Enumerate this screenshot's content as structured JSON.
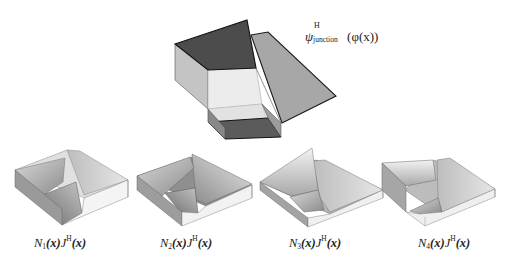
{
  "figure": {
    "main": {
      "label_symbol": "ψ",
      "label_superscript": "H",
      "label_subscript": "junction",
      "label_argument": "(φ(x))",
      "description": "3D rendering of a junction enrichment function"
    },
    "panels": [
      {
        "id": "N1",
        "basis": "N",
        "index": "1",
        "arg": "(x)",
        "enrich": "J",
        "enrich_sup": "H",
        "enrich_arg": "(x)"
      },
      {
        "id": "N2",
        "basis": "N",
        "index": "2",
        "arg": "(x)",
        "enrich": "J",
        "enrich_sup": "H",
        "enrich_arg": "(x)"
      },
      {
        "id": "N3",
        "basis": "N",
        "index": "3",
        "arg": "(x)",
        "enrich": "J",
        "enrich_sup": "H",
        "enrich_arg": "(x)"
      },
      {
        "id": "N4",
        "basis": "N",
        "index": "4",
        "arg": "(x)",
        "enrich": "J",
        "enrich_sup": "H",
        "enrich_arg": "(x)"
      }
    ],
    "colors": {
      "dark_face": "#4a4a4a",
      "mid_face": "#9a9a9a",
      "light_face": "#c8c8c8",
      "pale_face": "#e2e2e2",
      "edge": "#1a1a1a"
    }
  }
}
